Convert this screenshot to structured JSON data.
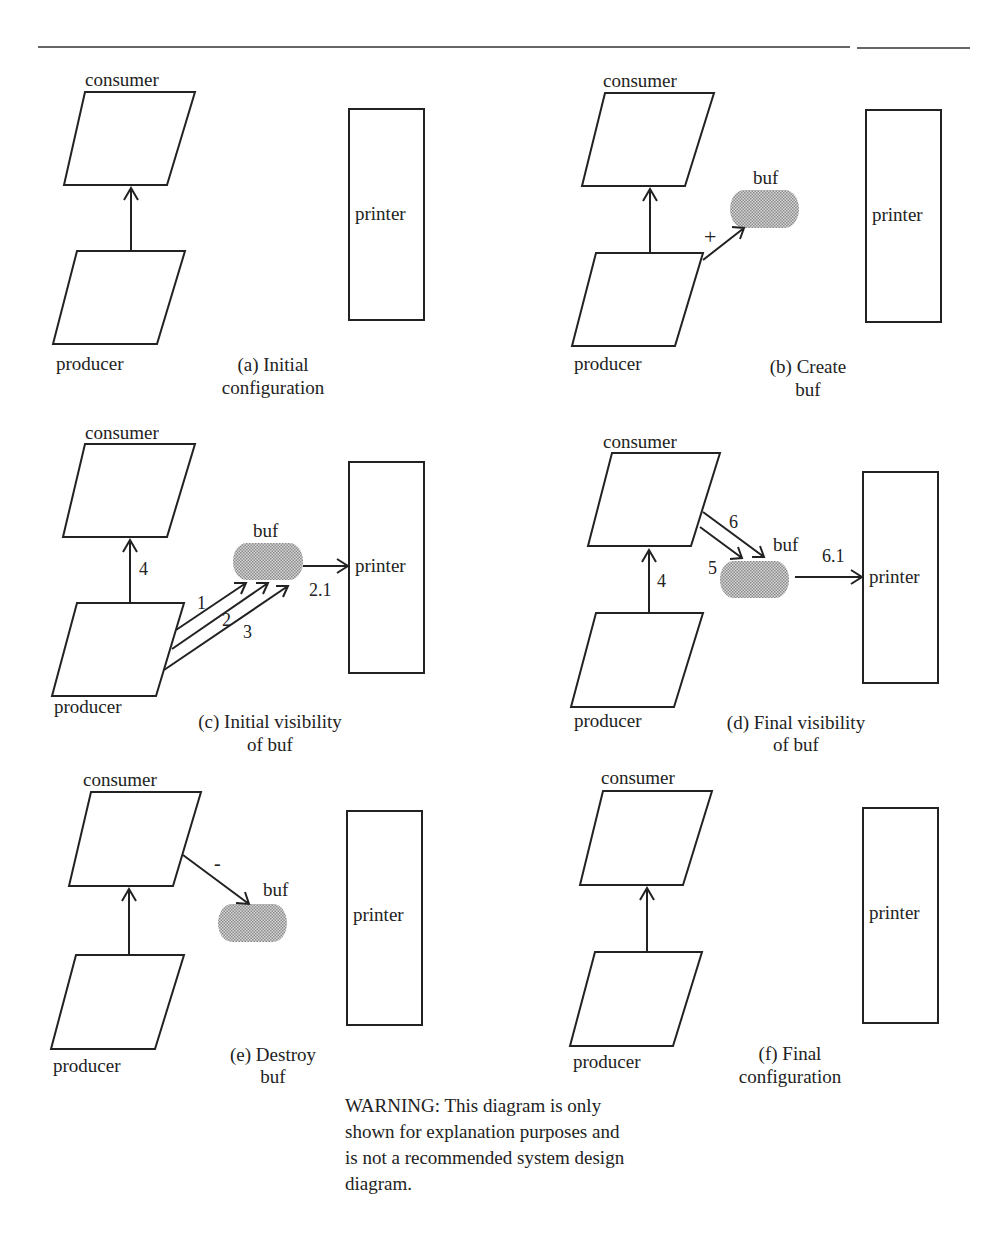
{
  "figure": {
    "rule": {
      "segments": [
        [
          38,
          850
        ],
        [
          857,
          970
        ]
      ],
      "y": 47
    },
    "colors": {
      "ink": "#222222",
      "buf_fill": "#b0b0b0",
      "background": "#ffffff"
    },
    "panels": [
      {
        "id": "a",
        "caption": [
          "(a) Initial",
          "configuration"
        ],
        "consumer_label": "consumer",
        "producer_label": "producer",
        "printer_label": "printer",
        "buf_label": null,
        "edges": [
          {
            "from": "producer",
            "to": "consumer",
            "label": ""
          }
        ]
      },
      {
        "id": "b",
        "caption": [
          "(b) Create",
          "buf"
        ],
        "consumer_label": "consumer",
        "producer_label": "producer",
        "printer_label": "printer",
        "buf_label": "buf",
        "edges": [
          {
            "from": "producer",
            "to": "consumer",
            "label": ""
          },
          {
            "from": "producer",
            "to": "buf",
            "label": "+"
          }
        ]
      },
      {
        "id": "c",
        "caption": [
          "(c) Initial visibility",
          "of buf"
        ],
        "consumer_label": "consumer",
        "producer_label": "producer",
        "printer_label": "printer",
        "buf_label": "buf",
        "edges": [
          {
            "from": "producer",
            "to": "consumer",
            "label": "4"
          },
          {
            "from": "producer",
            "to": "buf",
            "label": "1"
          },
          {
            "from": "producer",
            "to": "buf",
            "label": "2"
          },
          {
            "from": "producer",
            "to": "buf",
            "label": "3"
          },
          {
            "from": "buf",
            "to": "printer",
            "label": "2.1"
          }
        ]
      },
      {
        "id": "d",
        "caption": [
          "(d) Final visibility",
          "of buf"
        ],
        "consumer_label": "consumer",
        "producer_label": "producer",
        "printer_label": "printer",
        "buf_label": "buf",
        "edges": [
          {
            "from": "producer",
            "to": "consumer",
            "label": "4"
          },
          {
            "from": "consumer",
            "to": "buf",
            "label": "5"
          },
          {
            "from": "consumer",
            "to": "buf",
            "label": "6"
          },
          {
            "from": "buf",
            "to": "printer",
            "label": "6.1"
          }
        ]
      },
      {
        "id": "e",
        "caption": [
          "(e) Destroy",
          "buf"
        ],
        "consumer_label": "consumer",
        "producer_label": "producer",
        "printer_label": "printer",
        "buf_label": "buf",
        "edges": [
          {
            "from": "producer",
            "to": "consumer",
            "label": ""
          },
          {
            "from": "consumer",
            "to": "buf",
            "label": "-"
          }
        ]
      },
      {
        "id": "f",
        "caption": [
          "(f) Final",
          "configuration"
        ],
        "consumer_label": "consumer",
        "producer_label": "producer",
        "printer_label": "printer",
        "buf_label": null,
        "edges": [
          {
            "from": "producer",
            "to": "consumer",
            "label": ""
          }
        ]
      }
    ],
    "warning": [
      "WARNING: This diagram is only",
      "shown for explanation purposes and",
      "is not a recommended system design",
      "diagram."
    ]
  }
}
